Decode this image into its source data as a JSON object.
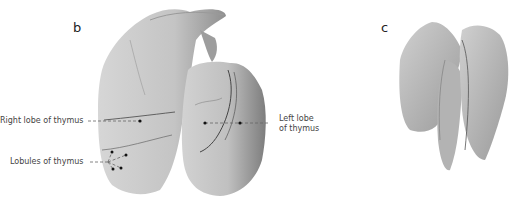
{
  "figure": {
    "panels": [
      {
        "letter": "b",
        "subject": "thymus-anterior-view"
      },
      {
        "letter": "c",
        "subject": "thymus-lobes-separated"
      }
    ],
    "labels": {
      "right_lobe": "Right lobe of thymus",
      "lobules": "Lobules of thymus",
      "left_lobe_line1": "Left lobe",
      "left_lobe_line2": "of thymus"
    },
    "colors": {
      "tissue_light": "#cfcfcf",
      "tissue_mid": "#b5b5b5",
      "tissue_dark": "#8e8e8e",
      "leader_line": "#666666",
      "text": "#444444"
    }
  }
}
